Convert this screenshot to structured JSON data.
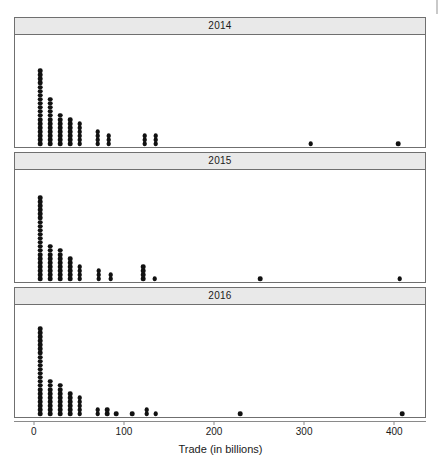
{
  "figure": {
    "type": "dotplot-trellis",
    "xlabel": "Trade (in billions)",
    "panel_titles": [
      "2014",
      "2015",
      "2016"
    ],
    "colors": {
      "dot": "#111111",
      "strip_bg": "#e9e9e9",
      "border": "#6f6f6f",
      "axis": "#8a8a8a"
    }
  },
  "axis": {
    "label": "Trade (in billions)",
    "ticks": [
      {
        "value": 0,
        "label": "0"
      },
      {
        "value": 100,
        "label": "100"
      },
      {
        "value": 200,
        "label": "200"
      },
      {
        "value": 300,
        "label": "300"
      },
      {
        "value": 400,
        "label": "400"
      }
    ],
    "xlim": [
      -22,
      433
    ]
  },
  "chart_data": {
    "type": "scatter",
    "title": "",
    "xlabel": "Trade (in billions)",
    "ylabel": "",
    "xlim": [
      -22,
      433
    ],
    "grid": false,
    "legend": "none",
    "panel_variable": "Year",
    "stack_direction": "up",
    "binwidth": 11,
    "series": [
      {
        "name": "2014",
        "stacks": [
          {
            "x": 6,
            "count": 19
          },
          {
            "x": 17,
            "count": 12
          },
          {
            "x": 28,
            "count": 8
          },
          {
            "x": 39,
            "count": 7
          },
          {
            "x": 50,
            "count": 6
          },
          {
            "x": 70,
            "count": 4
          },
          {
            "x": 82,
            "count": 3
          },
          {
            "x": 122,
            "count": 3
          },
          {
            "x": 134,
            "count": 3
          },
          {
            "x": 306,
            "count": 1
          },
          {
            "x": 403,
            "count": 1
          }
        ]
      },
      {
        "name": "2015",
        "stacks": [
          {
            "x": 6,
            "count": 21
          },
          {
            "x": 17,
            "count": 9
          },
          {
            "x": 28,
            "count": 8
          },
          {
            "x": 39,
            "count": 6
          },
          {
            "x": 50,
            "count": 4
          },
          {
            "x": 71,
            "count": 3
          },
          {
            "x": 84,
            "count": 2
          },
          {
            "x": 120,
            "count": 4
          },
          {
            "x": 133,
            "count": 1
          },
          {
            "x": 250,
            "count": 1
          },
          {
            "x": 405,
            "count": 1
          }
        ]
      },
      {
        "name": "2016",
        "stacks": [
          {
            "x": 6,
            "count": 22
          },
          {
            "x": 17,
            "count": 9
          },
          {
            "x": 28,
            "count": 8
          },
          {
            "x": 39,
            "count": 6
          },
          {
            "x": 50,
            "count": 5
          },
          {
            "x": 70,
            "count": 2
          },
          {
            "x": 80,
            "count": 2
          },
          {
            "x": 90,
            "count": 1
          },
          {
            "x": 108,
            "count": 1
          },
          {
            "x": 124,
            "count": 2
          },
          {
            "x": 134,
            "count": 1
          },
          {
            "x": 228,
            "count": 1
          },
          {
            "x": 408,
            "count": 1
          }
        ]
      }
    ]
  }
}
